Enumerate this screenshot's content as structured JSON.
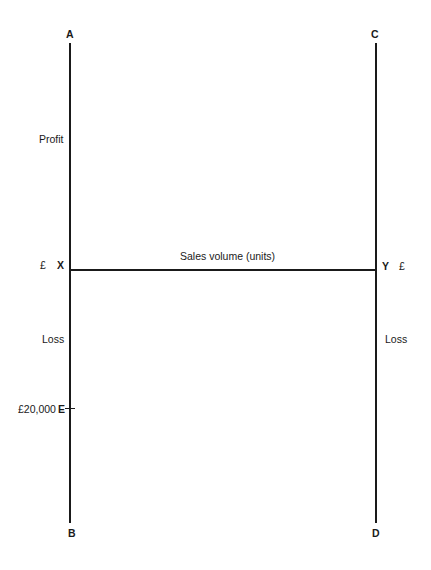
{
  "diagram": {
    "type": "breakeven-chart-framework",
    "corner_labels": {
      "top_left": "A",
      "bottom_left": "B",
      "top_right": "C",
      "bottom_right": "D"
    },
    "axis_points": {
      "left_origin": "X",
      "right_origin": "Y",
      "marker": "E"
    },
    "left_axis": {
      "profit_label": "Profit",
      "loss_label": "Loss",
      "currency": "£",
      "marker_value": "£20,000"
    },
    "right_axis": {
      "currency": "£",
      "loss_label": "Loss"
    },
    "x_axis": {
      "label": "Sales volume (units)"
    },
    "line_color": "#1a1a1a"
  }
}
